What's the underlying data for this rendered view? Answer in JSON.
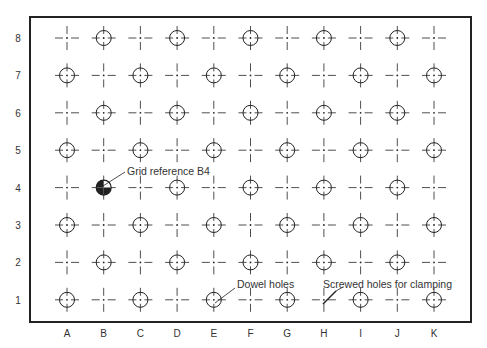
{
  "figure": {
    "row_labels": [
      "8",
      "7",
      "6",
      "5",
      "4",
      "3",
      "2",
      "1"
    ],
    "column_labels": [
      "A",
      "B",
      "C",
      "D",
      "E",
      "F",
      "G",
      "H",
      "I",
      "J",
      "K"
    ],
    "marker_types": {
      "circle": "hole-position (circle with crosshair)",
      "cross": "centre-line cross (no hole)",
      "filled": "highlighted grid reference"
    },
    "grid": [
      [
        "cross",
        "circle",
        "cross",
        "circle",
        "cross",
        "circle",
        "cross",
        "circle",
        "cross",
        "circle",
        "cross"
      ],
      [
        "circle",
        "cross",
        "circle",
        "cross",
        "circle",
        "cross",
        "circle",
        "cross",
        "circle",
        "cross",
        "circle"
      ],
      [
        "cross",
        "circle",
        "cross",
        "circle",
        "cross",
        "circle",
        "cross",
        "circle",
        "cross",
        "circle",
        "cross"
      ],
      [
        "circle",
        "cross",
        "circle",
        "cross",
        "circle",
        "cross",
        "circle",
        "cross",
        "circle",
        "cross",
        "circle"
      ],
      [
        "cross",
        "filled",
        "cross",
        "circle",
        "cross",
        "circle",
        "cross",
        "circle",
        "cross",
        "circle",
        "cross"
      ],
      [
        "circle",
        "cross",
        "circle",
        "cross",
        "circle",
        "cross",
        "circle",
        "cross",
        "circle",
        "cross",
        "circle"
      ],
      [
        "cross",
        "circle",
        "cross",
        "circle",
        "cross",
        "circle",
        "cross",
        "circle",
        "cross",
        "circle",
        "cross"
      ],
      [
        "circle",
        "cross",
        "circle",
        "cross",
        "circle",
        "cross",
        "circle",
        "cross",
        "circle",
        "cross",
        "circle"
      ]
    ],
    "annotations": [
      {
        "text": "Grid reference B4",
        "target": "B4"
      },
      {
        "text": "Dowel holes",
        "target": "E1"
      },
      {
        "text": "Screwed holes for clamping",
        "target": "H1"
      }
    ],
    "colors": {
      "ink": "#222222",
      "background": "#ffffff"
    }
  }
}
